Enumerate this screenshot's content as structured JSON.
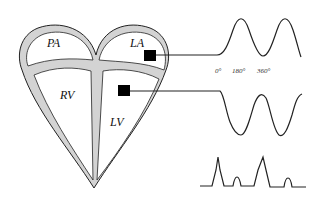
{
  "diagram": {
    "chambers": {
      "pa": "PA",
      "la": "LA",
      "rv": "RV",
      "lv": "LV"
    },
    "phase_ticks": [
      "0°",
      "180°",
      "360°"
    ],
    "colors": {
      "wall_fill": "#d3d3d3",
      "stroke": "#222222",
      "sensor": "#000000"
    },
    "traces": [
      {
        "name": "left-atrial-pressure",
        "shape": "sinusoid"
      },
      {
        "name": "left-ventricular-pressure",
        "shape": "sinusoid"
      },
      {
        "name": "ecg-like-trace",
        "shape": "pulses"
      }
    ]
  }
}
